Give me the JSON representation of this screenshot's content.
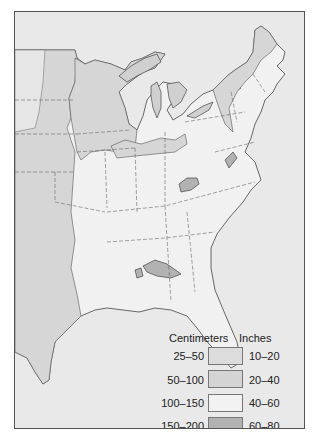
{
  "map": {
    "title": "",
    "region": "Eastern United States",
    "colors": {
      "background_water": "#e9e9e9",
      "c25_50": "#dcdcdc",
      "c50_100": "#d6d6d6",
      "c100_150": "#f1f1f1",
      "c150_200": "#b4b4b4",
      "border": "#555555"
    }
  },
  "legend": {
    "cm_header": "Centimeters",
    "in_header": "Inches",
    "items": [
      {
        "cm": "25–50",
        "in": "10–20",
        "color": "#dcdcdc"
      },
      {
        "cm": "50–100",
        "in": "20–40",
        "color": "#d4d4d4"
      },
      {
        "cm": "100–150",
        "in": "40–60",
        "color": "#f2f2f2"
      },
      {
        "cm": "150–200",
        "in": "60–80",
        "color": "#b2b2b2"
      }
    ]
  }
}
